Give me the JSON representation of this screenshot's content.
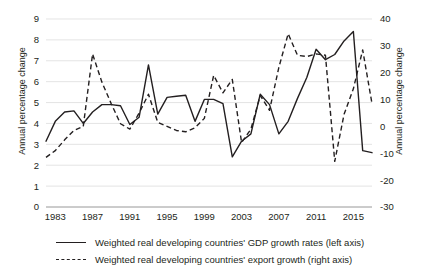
{
  "chart_data": {
    "type": "line",
    "title": "",
    "subtitle": "",
    "xlabel": "",
    "ylabel": "Annual percentage change",
    "y2label": "Annual percentage change",
    "grid": true,
    "legend_position": "bottom",
    "xlim": [
      1982,
      2017
    ],
    "ylim": [
      0,
      9
    ],
    "y2lim": [
      -30,
      40
    ],
    "x_tick_labels": [
      "1983",
      "1987",
      "1991",
      "1995",
      "1999",
      "2003",
      "2007",
      "2011",
      "2015"
    ],
    "x_ticks": [
      1983,
      1987,
      1991,
      1995,
      1999,
      2003,
      2007,
      2011,
      2015
    ],
    "y_tick_labels": [
      "0",
      "1",
      "2",
      "3",
      "4",
      "5",
      "6",
      "7",
      "8",
      "9"
    ],
    "y_ticks": [
      0,
      1,
      2,
      3,
      4,
      5,
      6,
      7,
      8,
      9
    ],
    "y2_tick_labels": [
      "-30",
      "-20",
      "-10",
      "0",
      "10",
      "20",
      "30",
      "40"
    ],
    "y2_ticks": [
      -30,
      -20,
      -10,
      0,
      10,
      20,
      30,
      40
    ],
    "x": [
      1982,
      1983,
      1984,
      1985,
      1986,
      1987,
      1988,
      1989,
      1990,
      1991,
      1992,
      1993,
      1994,
      1995,
      1996,
      1997,
      1998,
      1999,
      2000,
      2001,
      2002,
      2003,
      2004,
      2005,
      2006,
      2007,
      2008,
      2009,
      2010,
      2011,
      2012,
      2013,
      2014,
      2015,
      2016,
      2017
    ],
    "series": [
      {
        "name": "Weighted real developing countries' GDP growth rates (left axis)",
        "axis": "left",
        "style": "solid",
        "values": [
          3.15,
          4.1,
          4.55,
          4.6,
          4.0,
          4.55,
          4.9,
          4.9,
          4.85,
          3.95,
          4.3,
          6.8,
          4.45,
          5.25,
          5.3,
          5.35,
          4.1,
          5.15,
          5.15,
          4.95,
          2.4,
          3.15,
          3.5,
          5.4,
          4.9,
          3.5,
          4.1,
          5.2,
          6.2,
          7.55,
          7.05,
          7.3,
          7.95,
          8.4,
          2.7,
          2.6
        ]
      },
      {
        "name": "Weighted real developing countries' export growth (right axis)",
        "axis": "right",
        "style": "dashed",
        "values": [
          -11.5,
          -9.0,
          -5.0,
          -1.5,
          0.0,
          27.0,
          16.5,
          8.5,
          1.0,
          -1.0,
          5.0,
          12.0,
          1.5,
          0.0,
          -1.5,
          -2.0,
          -0.5,
          3.0,
          19.0,
          12.5,
          17.5,
          -6.0,
          -1.0,
          11.5,
          6.0,
          22.0,
          34.5,
          26.5,
          26.0,
          27.0,
          26.5,
          -13.0,
          4.5,
          14.0,
          28.5,
          8.5
        ]
      }
    ],
    "solid_series_plot_points": [
      [
        1982,
        3.15
      ],
      [
        1983,
        4.1
      ],
      [
        1984,
        4.55
      ],
      [
        1985,
        4.6
      ],
      [
        1986,
        4.0
      ],
      [
        1987,
        4.55
      ],
      [
        1988,
        4.9
      ],
      [
        1989,
        4.9
      ],
      [
        1990,
        4.85
      ],
      [
        1991,
        3.95
      ],
      [
        1992,
        4.3
      ],
      [
        1993,
        6.8
      ],
      [
        1994,
        4.45
      ],
      [
        1995,
        5.25
      ],
      [
        1996,
        5.3
      ],
      [
        1997,
        5.35
      ],
      [
        1998,
        4.1
      ],
      [
        1999,
        5.15
      ],
      [
        2000,
        5.15
      ],
      [
        2001,
        4.95
      ],
      [
        2002,
        2.4
      ],
      [
        2003,
        3.15
      ],
      [
        2004,
        3.5
      ],
      [
        2005,
        5.4
      ],
      [
        2006,
        4.9
      ],
      [
        2007,
        3.5
      ],
      [
        2008,
        4.1
      ],
      [
        2009,
        5.2
      ],
      [
        2010,
        6.2
      ],
      [
        2011,
        7.55
      ],
      [
        2012,
        7.05
      ],
      [
        2013,
        7.3
      ],
      [
        2014,
        7.95
      ],
      [
        2015,
        8.4
      ],
      [
        2016,
        2.7
      ],
      [
        2017,
        2.6
      ]
    ],
    "annotations": []
  },
  "legend": {
    "entries": [
      {
        "label": "Weighted real developing countries' GDP growth rates (left axis)",
        "style": "solid"
      },
      {
        "label": "Weighted real developing countries' export growth (right axis)",
        "style": "dashed"
      }
    ]
  },
  "axes": {
    "left_title": "Annual percentage change",
    "right_title": "Annual percentage change"
  }
}
